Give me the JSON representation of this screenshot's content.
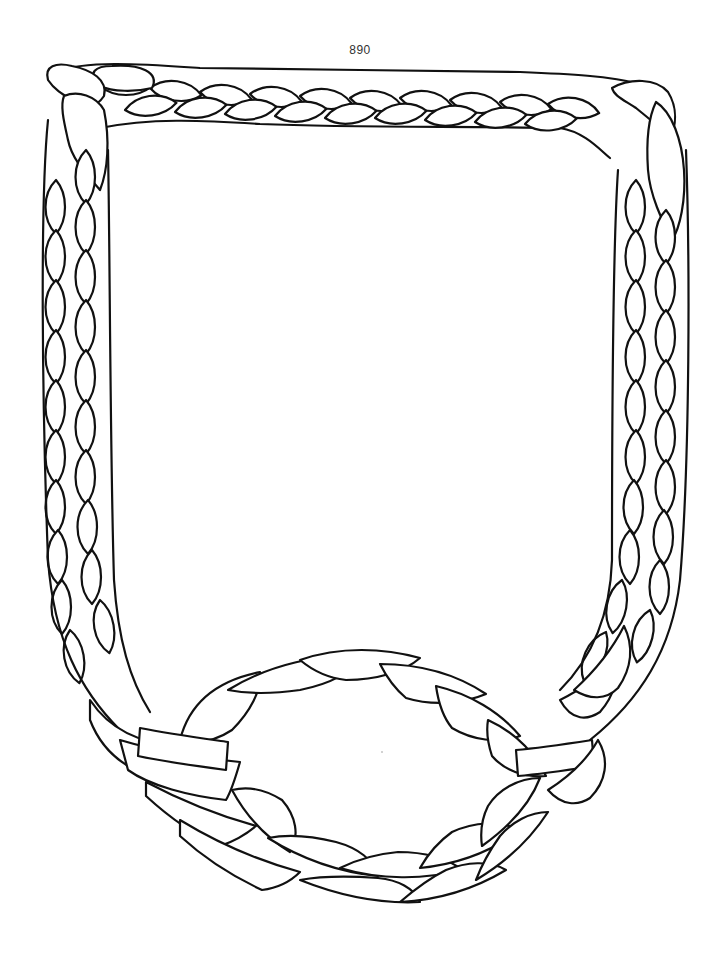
{
  "page": {
    "number": "890"
  },
  "artwork": {
    "subject": "braided-rope-frame",
    "description": "Three-strand braided rope border forming a rectangular frame with a braided oval ring woven into the bottom edge",
    "stroke_color": "#111111",
    "background_color": "#ffffff"
  }
}
